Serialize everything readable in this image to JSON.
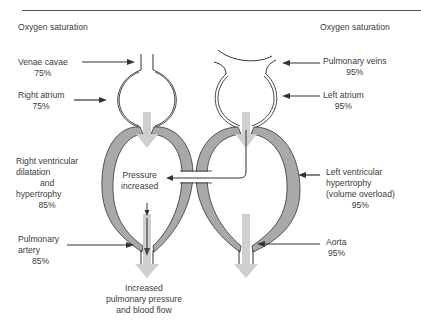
{
  "header": {
    "left_title": "Oxygen saturation",
    "right_title": "Oxygen saturation"
  },
  "left_labels": {
    "venae_cavae": {
      "name": "Venae cavae",
      "value": "75%"
    },
    "right_atrium": {
      "name": "Right atrium",
      "value": "75%"
    },
    "right_ventricle": {
      "line1": "Right ventricular",
      "line2": "dilatation",
      "line3": "and",
      "line4": "hypertrophy",
      "value": "85%"
    },
    "pulmonary_artery": {
      "line1": "Pulmonary",
      "line2": "artery",
      "value": "85%"
    }
  },
  "right_labels": {
    "pulmonary_veins": {
      "name": "Pulmonary veins",
      "value": "95%"
    },
    "left_atrium": {
      "name": "Left atrium",
      "value": "95%"
    },
    "left_ventricle": {
      "line1": "Left ventricular",
      "line2": "hypertrophy",
      "line3": "(volume overload)",
      "value": "95%"
    },
    "aorta": {
      "name": "Aorta",
      "value": "95%"
    }
  },
  "center_labels": {
    "pressure": {
      "line1": "Pressure",
      "line2": "increased"
    },
    "outcome": {
      "line1": "Increased",
      "line2": "pulmonary pressure",
      "line3": "and blood flow"
    }
  },
  "colors": {
    "wall_fill": "#a9a9a9",
    "flow_arrow": "#cfcfcf",
    "line": "#333333",
    "text": "#3c3c3c"
  }
}
